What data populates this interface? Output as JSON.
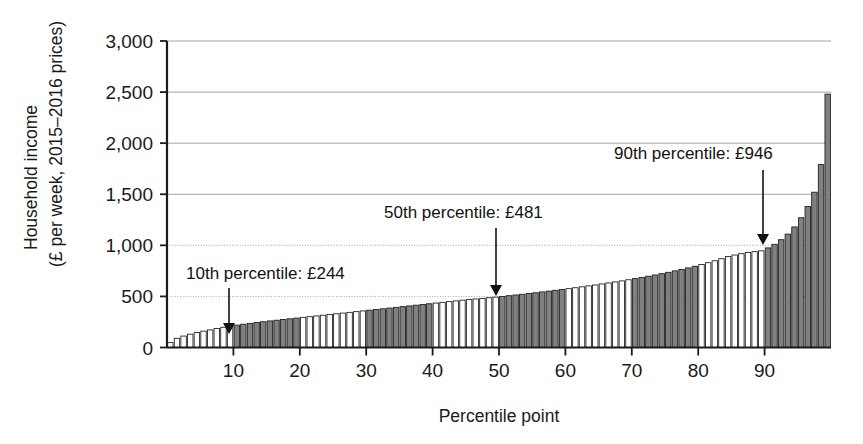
{
  "chart_data": {
    "type": "bar",
    "title": "",
    "xlabel": "Percentile point",
    "ylabel": "Household income\n(£ per week, 2015–2016 prices)",
    "ylabel_line1": "Household income",
    "ylabel_line2": "(£ per week, 2015–2016 prices)",
    "ylim": [
      0,
      3000
    ],
    "xlim": [
      0,
      100
    ],
    "ytick_labels": [
      "0",
      "500",
      "1,000",
      "1,500",
      "2,000",
      "2,500",
      "3,000"
    ],
    "ytick_values": [
      0,
      500,
      1000,
      1500,
      2000,
      2500,
      3000
    ],
    "xtick_labels": [
      "10",
      "20",
      "30",
      "40",
      "50",
      "60",
      "70",
      "80",
      "90"
    ],
    "xtick_values": [
      10,
      20,
      30,
      40,
      50,
      60,
      70,
      80,
      90
    ],
    "grid": "horizontal",
    "legend": "none",
    "bar_fill_light": "#ffffff",
    "bar_fill_dark": "#808080",
    "bar_edge": "#1a1a1a",
    "axis_color": "#1a1a1a",
    "grid_color": "#9a9a9a",
    "shading_note": "Alternating decile bands: percentiles 1-10 light, 11-20 dark, 21-30 light, 31-40 dark, 41-50 light, 51-60 dark, 61-70 light, 71-80 dark, 81-90 light, 91-100 dark",
    "categories": [
      1,
      2,
      3,
      4,
      5,
      6,
      7,
      8,
      9,
      10,
      11,
      12,
      13,
      14,
      15,
      16,
      17,
      18,
      19,
      20,
      21,
      22,
      23,
      24,
      25,
      26,
      27,
      28,
      29,
      30,
      31,
      32,
      33,
      34,
      35,
      36,
      37,
      38,
      39,
      40,
      41,
      42,
      43,
      44,
      45,
      46,
      47,
      48,
      49,
      50,
      51,
      52,
      53,
      54,
      55,
      56,
      57,
      58,
      59,
      60,
      61,
      62,
      63,
      64,
      65,
      66,
      67,
      68,
      69,
      70,
      71,
      72,
      73,
      74,
      75,
      76,
      77,
      78,
      79,
      80,
      81,
      82,
      83,
      84,
      85,
      86,
      87,
      88,
      89,
      90,
      91,
      92,
      93,
      94,
      95,
      96,
      97,
      98,
      99,
      100
    ],
    "values": [
      48,
      90,
      112,
      130,
      146,
      160,
      172,
      186,
      198,
      210,
      219,
      228,
      236,
      244,
      252,
      260,
      267,
      274,
      281,
      288,
      295,
      302,
      309,
      316,
      323,
      330,
      337,
      344,
      351,
      358,
      365,
      372,
      379,
      386,
      393,
      400,
      407,
      414,
      421,
      428,
      435,
      442,
      449,
      456,
      463,
      469,
      475,
      481,
      487,
      493,
      500,
      507,
      514,
      521,
      528,
      536,
      544,
      552,
      560,
      568,
      576,
      585,
      594,
      603,
      612,
      622,
      632,
      642,
      652,
      663,
      674,
      686,
      698,
      710,
      723,
      736,
      750,
      764,
      779,
      795,
      812,
      830,
      849,
      869,
      890,
      905,
      918,
      930,
      938,
      946,
      975,
      1010,
      1055,
      1110,
      1180,
      1270,
      1380,
      1520,
      1790,
      2480
    ],
    "annotations": [
      {
        "name": "p10",
        "text": "10th percentile: £244",
        "percentile": 10,
        "value": 244,
        "label_x": 186,
        "label_y": 279,
        "arrow_x": 229,
        "arrow_top": 288,
        "arrow_bottom": 334
      },
      {
        "name": "p50",
        "text": "50th percentile: £481",
        "percentile": 50,
        "value": 481,
        "label_x": 384,
        "label_y": 218,
        "arrow_x": 496,
        "arrow_top": 228,
        "arrow_bottom": 296
      },
      {
        "name": "p90",
        "text": "90th percentile: £946",
        "percentile": 90,
        "value": 946,
        "label_x": 614,
        "label_y": 159,
        "arrow_x": 763,
        "arrow_top": 170,
        "arrow_bottom": 245
      }
    ]
  }
}
